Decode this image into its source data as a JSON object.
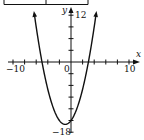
{
  "chart_data": {
    "type": "line",
    "title": "",
    "function": "y = x^2 + 2x - 15",
    "xlabel": "x",
    "ylabel": "y",
    "xlim": [
      -10,
      10
    ],
    "ylim": [
      -18,
      12
    ],
    "x_tick_step": 2,
    "y_tick_step": 3,
    "tick_labels": {
      "x_min": "-10",
      "x_max": "10",
      "origin": "0",
      "y_max": "12",
      "y_min": "-18"
    },
    "grid": false,
    "series": [
      {
        "name": "parabola",
        "x": [
          -6.4,
          -6,
          -5,
          -4,
          -3,
          -2,
          -1,
          0,
          1,
          2,
          3,
          4,
          4.4
        ],
        "values": [
          13,
          9,
          0,
          -7,
          -12,
          -15,
          -16,
          -15,
          -12,
          -7,
          0,
          9,
          13
        ]
      }
    ],
    "key_points": {
      "roots": [
        -5,
        3
      ],
      "vertex": [
        -1,
        -16
      ],
      "y_intercept": -15
    }
  },
  "labels": {
    "x_axis": "x",
    "y_axis": "y",
    "x_min": "−10",
    "x_max": "10",
    "origin": "0",
    "y_max": "12",
    "y_min": "−18"
  }
}
